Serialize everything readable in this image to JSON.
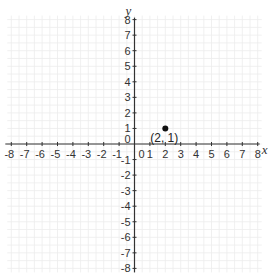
{
  "chart_data": {
    "type": "scatter",
    "title": "",
    "xlabel": "x",
    "ylabel": "y",
    "xlim": [
      -8,
      8
    ],
    "ylim": [
      -8,
      8
    ],
    "grid": true,
    "x_ticks": [
      -8,
      -7,
      -6,
      -5,
      -4,
      -3,
      -2,
      -1,
      0,
      1,
      2,
      3,
      4,
      5,
      6,
      7,
      8
    ],
    "y_ticks": [
      -8,
      -7,
      -6,
      -5,
      -4,
      -3,
      -2,
      -1,
      0,
      1,
      2,
      3,
      4,
      5,
      6,
      7,
      8
    ],
    "series": [
      {
        "name": "point",
        "points": [
          {
            "x": 2,
            "y": 1,
            "label": "(2, 1)"
          }
        ]
      }
    ],
    "legend": null
  },
  "axes": {
    "x_name": "x",
    "y_name": "y",
    "origin_label": "0"
  },
  "style": {
    "axis_color": "#333333",
    "grid_color": "#ececec",
    "point_color": "#111111"
  }
}
